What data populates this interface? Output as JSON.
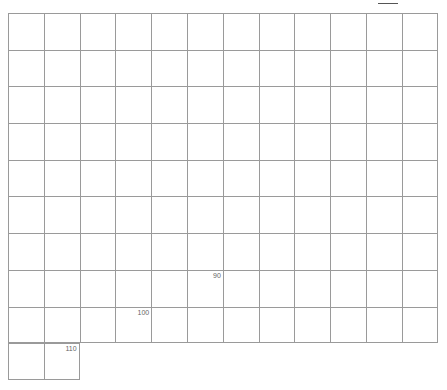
{
  "grid": {
    "columns": 12,
    "rows": 10,
    "line_color": "#9a9a9a",
    "last_row_cells": 2
  },
  "labels": [
    {
      "text": "90",
      "row": 7,
      "col": 5
    },
    {
      "text": "100",
      "row": 8,
      "col": 3
    },
    {
      "text": "110",
      "row": 9,
      "col": 1
    }
  ]
}
